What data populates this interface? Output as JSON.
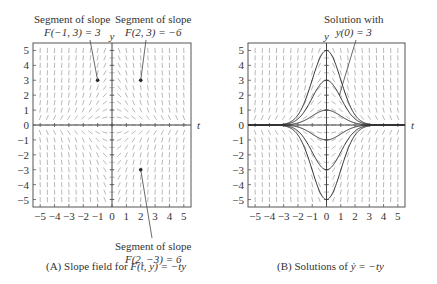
{
  "panelA": {
    "caption_prefix": "(A)  Slope field for ",
    "caption_func": "F(t, y) = −ty",
    "annotations": [
      {
        "line1": "Segment of slope",
        "line2": "F(−1, 3) = 3"
      },
      {
        "line1": "Segment of slope",
        "line2": "F(2, 3) = −6"
      },
      {
        "line1": "Segment of slope",
        "line2": "F(2, −3) = 6"
      }
    ],
    "axis_t": "t",
    "axis_y": "y"
  },
  "panelB": {
    "caption_prefix": "(B)  Solutions of ",
    "caption_func": "ẏ = −ty",
    "annotation": {
      "line1": "Solution with",
      "line2": "y(0) = 3"
    },
    "axis_t": "t",
    "axis_y": "y"
  },
  "ticks": {
    "x": [
      "−5",
      "−4",
      "−3",
      "−2",
      "−1",
      "0",
      "1",
      "2",
      "3",
      "4",
      "5"
    ],
    "y": [
      "5",
      "4",
      "3",
      "2",
      "1",
      "0",
      "−1",
      "−2",
      "−3",
      "−4",
      "−5"
    ]
  },
  "chart_data": [
    {
      "type": "slope-field",
      "title": "(A) Slope field for F(t, y) = −ty",
      "xlabel": "t",
      "ylabel": "y",
      "xlim": [
        -5.5,
        5.5
      ],
      "ylim": [
        -5.5,
        5.5
      ],
      "slope_function": "-t*y",
      "marked_points": [
        {
          "t": -1,
          "y": 3,
          "slope": 3
        },
        {
          "t": 2,
          "y": 3,
          "slope": -6
        },
        {
          "t": 2,
          "y": -3,
          "slope": 6
        }
      ]
    },
    {
      "type": "line",
      "title": "(B) Solutions of ẏ = −ty",
      "xlabel": "t",
      "ylabel": "y",
      "xlim": [
        -5.5,
        5.5
      ],
      "ylim": [
        -5.5,
        5.5
      ],
      "series_formula": "y = y0 * exp(-t^2/2)",
      "initial_values": [
        5,
        3,
        1,
        0,
        -1,
        -3,
        -5
      ],
      "highlighted": {
        "y0": 3,
        "label": "Solution with y(0) = 3"
      }
    }
  ]
}
